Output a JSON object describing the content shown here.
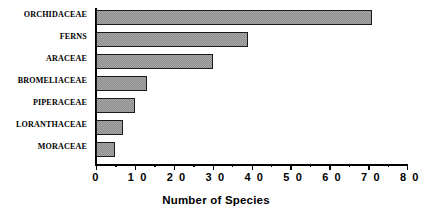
{
  "chart_data": {
    "type": "bar",
    "orientation": "horizontal",
    "title": "",
    "xlabel": "Number of Species",
    "ylabel": "",
    "categories": [
      "ORCHIDACEAE",
      "FERNS",
      "ARACEAE",
      "BROMELIACEAE",
      "PIPERACEAE",
      "LORANTHACEAE",
      "MORACEAE"
    ],
    "values": [
      71,
      39,
      30,
      13,
      10,
      7,
      5
    ],
    "xlim": [
      0,
      80
    ],
    "xticks": [
      0,
      10,
      20,
      30,
      40,
      50,
      60,
      70,
      80
    ],
    "xtick_labels": [
      "0",
      "1 0",
      "2 0",
      "3 0",
      "4 0",
      "5 0",
      "6 0",
      "7 0",
      "8 0"
    ],
    "minor_xticks": [
      5,
      15,
      25,
      35,
      45,
      55,
      65,
      75
    ],
    "grid": false,
    "legend": null,
    "bar_fill": "#a8a8a8",
    "bar_pattern": "fine-checker-dither",
    "bar_edge_color": "#1a1a1a",
    "axis_color": "#000000"
  }
}
